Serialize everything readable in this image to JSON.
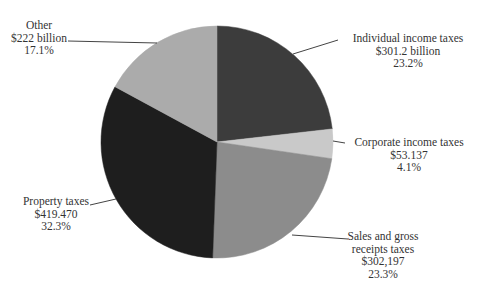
{
  "chart_data": {
    "type": "pie",
    "title": "",
    "start_angle_deg": 0,
    "direction": "clockwise",
    "slices": [
      {
        "name": "Individual income taxes",
        "value_label": "$301.2 billion",
        "percent": 23.2,
        "color": "#3c3c3c"
      },
      {
        "name": "Corporate income taxes",
        "value_label": "$53.137",
        "percent": 4.1,
        "color": "#c9c9c9"
      },
      {
        "name": "Sales and gross receipts taxes",
        "value_label": "$302,197",
        "percent": 23.3,
        "color": "#8c8c8c"
      },
      {
        "name": "Property taxes",
        "value_label": "$419.470",
        "percent": 32.3,
        "color": "#1e1e1e"
      },
      {
        "name": "Other",
        "value_label": "$222 billion",
        "percent": 17.1,
        "color": "#ababab"
      }
    ],
    "legend": "none (callout labels)"
  },
  "labels": {
    "individual": {
      "line1": "Individual income taxes",
      "line2": "$301.2 billion",
      "line3": "23.2%"
    },
    "corporate": {
      "line1": "Corporate income taxes",
      "line2": "$53.137",
      "line3": "4.1%"
    },
    "sales": {
      "line1": "Sales and gross",
      "line2": "receipts taxes",
      "line3": "$302,197",
      "line4": "23.3%"
    },
    "property": {
      "line1": "Property taxes",
      "line2": "$419.470",
      "line3": "32.3%"
    },
    "other": {
      "line1": "Other",
      "line2": "$222 billion",
      "line3": "17.1%"
    }
  }
}
